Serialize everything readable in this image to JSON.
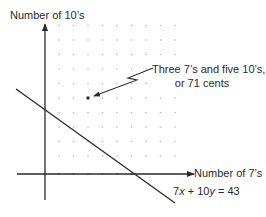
{
  "diagram": {
    "type": "graph-with-dot-lattice",
    "y_axis_label": "Number of 10’s",
    "x_axis_label": "Number of 7’s",
    "equation": {
      "coef_x": "7",
      "var_x": "x",
      "plus": " + ",
      "coef_y": "10",
      "var_y": "y",
      "rhs": " = 43"
    },
    "callout": {
      "line1": "Three 7’s and five 10’s,",
      "line2": "or 71 cents"
    },
    "highlighted_point": {
      "x": 3,
      "y": 5,
      "value_cents": 71
    },
    "lattice": {
      "columns": 9,
      "rows": 10
    },
    "colors": {
      "ink": "#2a2a2a",
      "dots": "#b0b0b0",
      "background": "#ffffff"
    }
  }
}
